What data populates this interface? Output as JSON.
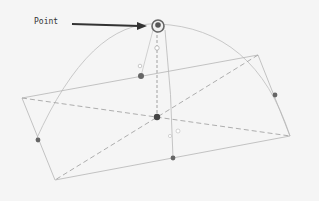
{
  "annotation": {
    "label": "Point",
    "arrow_color": "#333333"
  },
  "colors": {
    "background": "#f5f5f5",
    "line": "#b8b8b8",
    "dashed": "#a8a8a8",
    "point": "#555555",
    "point_highlight_ring": "#666666"
  },
  "diagram": {
    "quadrilateral": [
      [
        22,
        98
      ],
      [
        258,
        55
      ],
      [
        290,
        136
      ],
      [
        55,
        180
      ]
    ],
    "diagonals": [
      [
        [
          22,
          98
        ],
        [
          290,
          136
        ]
      ],
      [
        [
          258,
          55
        ],
        [
          55,
          180
        ]
      ]
    ],
    "arc": "M 36 140 Q 90 20 158 24 Q 255 28 290 136",
    "vertical_dashed": [
      [
        157,
        30
      ],
      [
        157,
        117
      ]
    ],
    "curve_through": "M 165 30 Q 172 95 173 158",
    "points": [
      {
        "name": "top-point",
        "x": 158,
        "y": 26,
        "highlighted": true
      },
      {
        "name": "top-edge-point",
        "x": 141,
        "y": 76
      },
      {
        "name": "center-point",
        "x": 157,
        "y": 117
      },
      {
        "name": "left-edge-point",
        "x": 38,
        "y": 140
      },
      {
        "name": "right-edge-point",
        "x": 275,
        "y": 95
      },
      {
        "name": "bottom-edge-point",
        "x": 173,
        "y": 158
      }
    ],
    "open_points": [
      {
        "x": 157,
        "y": 48
      },
      {
        "x": 140,
        "y": 66
      },
      {
        "x": 178,
        "y": 131
      },
      {
        "x": 170,
        "y": 136
      }
    ]
  }
}
